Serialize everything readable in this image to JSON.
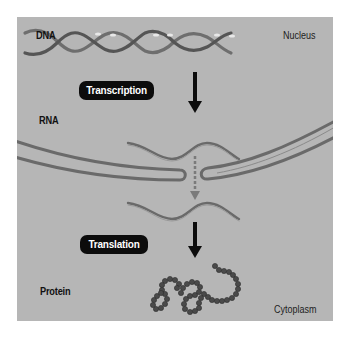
{
  "diagram": {
    "regions": {
      "nucleus": "Nucleus",
      "cytoplasm": "Cytoplasm"
    },
    "molecules": {
      "dna": "DNA",
      "rna": "RNA",
      "protein": "Protein"
    },
    "processes": {
      "transcription": "Transcription",
      "translation": "Translation"
    },
    "colors": {
      "background": "#b6b6b6",
      "membrane": "#6a6a6a",
      "pill": "#0c0c0c",
      "pill_text": "#ffffff",
      "arrow": "#0c0c0c",
      "dashed_arrow": "#7a7a7a",
      "protein_beads": "#4a4a4a"
    }
  }
}
